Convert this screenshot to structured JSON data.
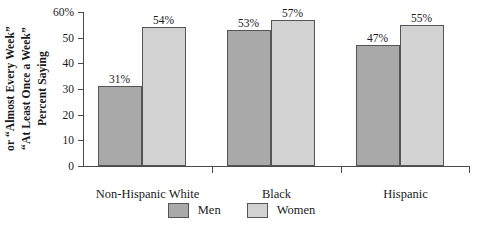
{
  "chart_data": {
    "type": "bar",
    "title": "",
    "xlabel": "",
    "ylabel_lines": [
      "Percent Saying",
      "“At Least Once a Week”",
      "or “Almost Every Week”"
    ],
    "categories": [
      "Non-Hispanic White",
      "Black",
      "Hispanic"
    ],
    "series": [
      {
        "name": "Men",
        "color": "#a9a9a9",
        "values": [
          31,
          53,
          47
        ]
      },
      {
        "name": "Women",
        "color": "#d2d2d2",
        "values": [
          54,
          57,
          55
        ]
      }
    ],
    "data_labels": {
      "Men": [
        "31%",
        "53%",
        "47%"
      ],
      "Women": [
        "54%",
        "57%",
        "55%"
      ]
    },
    "ylim": [
      0,
      60
    ],
    "ytick_values": [
      0,
      10,
      20,
      30,
      40,
      50,
      60
    ],
    "ytick_labels": [
      "0",
      "10",
      "20",
      "30",
      "40",
      "50",
      "60%"
    ],
    "grid": false,
    "legend_position": "bottom"
  },
  "legend": {
    "items": [
      {
        "label": "Men",
        "color": "#a9a9a9"
      },
      {
        "label": "Women",
        "color": "#d2d2d2"
      }
    ]
  }
}
